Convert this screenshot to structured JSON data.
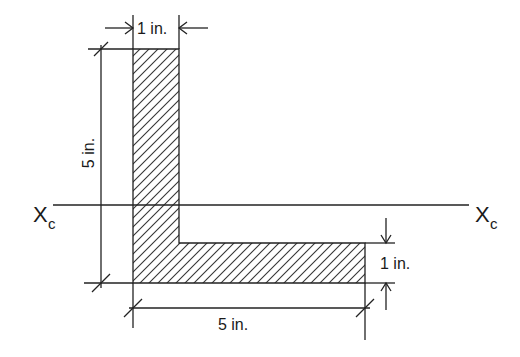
{
  "figure": {
    "type": "cross-section diagram",
    "shape": "L-shaped (angle) section",
    "colors": {
      "line": "#222222",
      "hatch": "#333333",
      "background": "#ffffff"
    }
  },
  "dimensions": {
    "top_width": "1 in.",
    "left_height": "5 in.",
    "right_thickness": "1 in.",
    "bottom_width": "5 in."
  },
  "axis": {
    "left_label_main": "X",
    "left_label_sub": "c",
    "right_label_main": "X",
    "right_label_sub": "c"
  }
}
